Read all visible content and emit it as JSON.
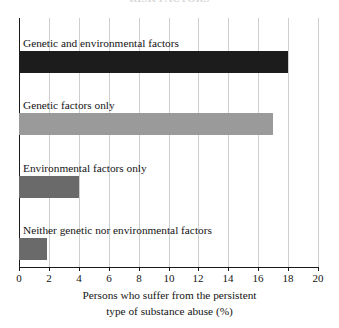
{
  "chart_data": {
    "type": "bar",
    "orientation": "horizontal",
    "title": "RISK FACTORS",
    "title_visible": false,
    "categories": [
      "Genetic and environmental factors",
      "Genetic factors only",
      "Environmental factors only",
      "Neither genetic nor environmental factors"
    ],
    "values": [
      18,
      17,
      4,
      1.9
    ],
    "bar_colors": [
      "#1c1c1c",
      "#9a9a9a",
      "#6a6a6a",
      "#6a6a6a"
    ],
    "xlabel_lines": [
      "Persons who suffer from the persistent",
      "type of substance abuse (%)"
    ],
    "ylabel": "",
    "xlim": [
      0,
      20
    ],
    "xticks": [
      0,
      2,
      4,
      6,
      8,
      10,
      12,
      14,
      16,
      18,
      20
    ],
    "xtick_labels": [
      "0",
      "2",
      "4",
      "6",
      "8",
      "10",
      "12",
      "14",
      "16",
      "18",
      "20"
    ],
    "grid": true,
    "grid_axis": "x",
    "grid_color": "#cfcfcf",
    "legend": false,
    "legend_position": "none",
    "label_placement": "above-bar-inside-plot",
    "axis_color": "#1a1a1a",
    "background": "#ffffff"
  }
}
